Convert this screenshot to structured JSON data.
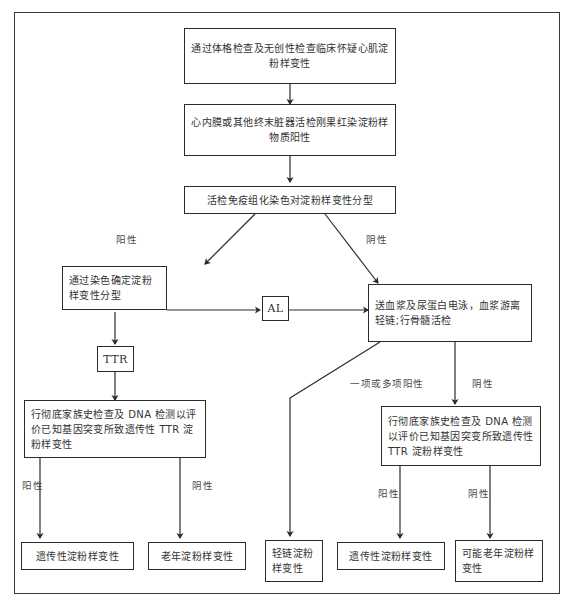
{
  "diagram": {
    "line_color": "#2b2b2b",
    "text_color": "#333333",
    "background": "#ffffff",
    "nodes": {
      "clinical_suspicion": "通过体格检查及无创性检查临床怀疑心肌淀粉样变性",
      "biopsy_congo_red": "心内膜或其他终末脏器活检刚果红染淀粉样物质阳性",
      "immunohistochemistry": "活检免疫组化染色对淀粉样变性分型",
      "stain_typing": "通过染色确定淀粉样变性分型",
      "al": "AL",
      "ttr": "TTR",
      "plasma_urine_tests": "送血浆及尿蛋白电泳，血浆游离轻链;行骨髓活检",
      "family_dna_left": "行彻底家族史检查及 DNA 检测以评价已知基因突变所致遗传性 TTR 淀粉样变性",
      "family_dna_right": "行彻底家族史检查及 DNA 检测以评价已知基因突变所致遗传性 TTR 淀粉样变性",
      "outcome_hereditary_left": "遗传性淀粉样变性",
      "outcome_senile": "老年淀粉样变性",
      "outcome_light_chain": "轻链淀粉样变性",
      "outcome_hereditary_right": "遗传性淀粉样变性",
      "outcome_possible_senile": "可能老年淀粉样变性"
    },
    "edge_labels": {
      "ihc_positive": "阳性",
      "ihc_negative": "阴性",
      "tests_one_or_more_positive": "一项或多项阳性",
      "tests_negative": "阴性",
      "dna_left_positive": "阳性",
      "dna_left_negative": "阴性",
      "dna_right_positive": "阳性",
      "dna_right_negative": "阴性"
    }
  }
}
